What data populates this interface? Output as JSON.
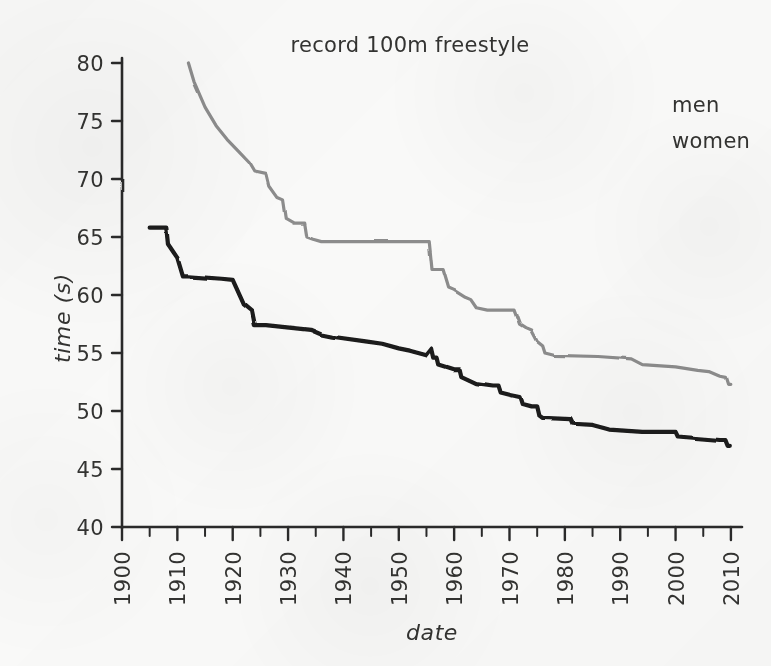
{
  "chart_data": {
    "type": "line",
    "title": "record 100m freestyle",
    "xlabel": "date",
    "ylabel": "time (s)",
    "xlim": [
      1900,
      2012
    ],
    "ylim": [
      40,
      80
    ],
    "xticks": [
      1900,
      1910,
      1920,
      1930,
      1940,
      1950,
      1960,
      1970,
      1980,
      1990,
      2000,
      2010
    ],
    "yticks": [
      40,
      45,
      50,
      55,
      60,
      65,
      70,
      75,
      80
    ],
    "xtick_labels": [
      "1900",
      "1910",
      "1920",
      "1930",
      "1940",
      "1950",
      "1960",
      "1970",
      "1980",
      "1990",
      "2000",
      "2010"
    ],
    "ytick_labels": [
      "40",
      "45",
      "50",
      "55",
      "60",
      "65",
      "70",
      "75",
      "80"
    ],
    "minor_xtick_interval": 5,
    "grid": false,
    "legend_position": "top-right",
    "style": "hand-drawn",
    "series": [
      {
        "name": "men",
        "color": "#1a1a1a",
        "linewidth": 4.2,
        "points": [
          [
            1905.0,
            65.8
          ],
          [
            1908.0,
            65.8
          ],
          [
            1908.3,
            64.4
          ],
          [
            1910.0,
            63.2
          ],
          [
            1911.0,
            61.6
          ],
          [
            1912.0,
            61.6
          ],
          [
            1918.0,
            61.4
          ],
          [
            1920.0,
            61.3
          ],
          [
            1922.0,
            59.2
          ],
          [
            1923.5,
            58.6
          ],
          [
            1924.0,
            57.4
          ],
          [
            1926.0,
            57.4
          ],
          [
            1934.0,
            57.0
          ],
          [
            1936.0,
            56.6
          ],
          [
            1938.0,
            56.4
          ],
          [
            1944.0,
            56.0
          ],
          [
            1947.0,
            55.8
          ],
          [
            1950.0,
            55.4
          ],
          [
            1952.0,
            55.2
          ],
          [
            1955.0,
            54.8
          ],
          [
            1956.0,
            55.4
          ],
          [
            1956.4,
            54.6
          ],
          [
            1957.0,
            54.6
          ],
          [
            1957.3,
            54.0
          ],
          [
            1960.0,
            53.6
          ],
          [
            1961.0,
            53.6
          ],
          [
            1961.3,
            53.0
          ],
          [
            1964.0,
            52.4
          ],
          [
            1967.0,
            52.2
          ],
          [
            1968.0,
            52.2
          ],
          [
            1968.4,
            51.6
          ],
          [
            1970.0,
            51.4
          ],
          [
            1972.0,
            51.2
          ],
          [
            1972.4,
            50.6
          ],
          [
            1974.0,
            50.4
          ],
          [
            1975.0,
            50.4
          ],
          [
            1975.4,
            49.6
          ],
          [
            1976.0,
            49.4
          ],
          [
            1981.0,
            49.3
          ],
          [
            1981.4,
            48.9
          ],
          [
            1985.0,
            48.8
          ],
          [
            1988.0,
            48.4
          ],
          [
            1994.0,
            48.2
          ],
          [
            2000.0,
            48.2
          ],
          [
            2000.4,
            47.8
          ],
          [
            2008.0,
            47.5
          ],
          [
            2009.0,
            47.5
          ],
          [
            2009.4,
            47.0
          ],
          [
            2009.8,
            47.0
          ]
        ]
      },
      {
        "name": "women",
        "color": "#8c8c8c",
        "linewidth": 3.2,
        "points": [
          [
            1912.0,
            80.0
          ],
          [
            1913.0,
            78.4
          ],
          [
            1915.0,
            76.2
          ],
          [
            1917.0,
            74.6
          ],
          [
            1919.0,
            73.4
          ],
          [
            1921.0,
            72.4
          ],
          [
            1923.0,
            71.4
          ],
          [
            1924.0,
            70.6
          ],
          [
            1926.0,
            70.4
          ],
          [
            1926.5,
            69.4
          ],
          [
            1928.0,
            68.4
          ],
          [
            1929.0,
            68.2
          ],
          [
            1929.5,
            66.6
          ],
          [
            1931.0,
            66.2
          ],
          [
            1933.0,
            66.2
          ],
          [
            1933.4,
            65.0
          ],
          [
            1934.5,
            64.8
          ],
          [
            1936.0,
            64.6
          ],
          [
            1955.5,
            64.6
          ],
          [
            1956.0,
            62.2
          ],
          [
            1958.0,
            62.2
          ],
          [
            1959.0,
            60.6
          ],
          [
            1960.0,
            60.4
          ],
          [
            1962.0,
            59.8
          ],
          [
            1963.0,
            59.6
          ],
          [
            1964.0,
            58.9
          ],
          [
            1966.0,
            58.7
          ],
          [
            1971.0,
            58.7
          ],
          [
            1972.0,
            57.4
          ],
          [
            1973.0,
            57.1
          ],
          [
            1974.0,
            56.9
          ],
          [
            1975.0,
            56.0
          ],
          [
            1976.0,
            55.6
          ],
          [
            1976.4,
            55.0
          ],
          [
            1978.0,
            54.8
          ],
          [
            1986.0,
            54.7
          ],
          [
            1992.0,
            54.5
          ],
          [
            1994.0,
            54.0
          ],
          [
            2000.0,
            53.8
          ],
          [
            2004.0,
            53.5
          ],
          [
            2006.0,
            53.4
          ],
          [
            2008.0,
            53.0
          ],
          [
            2009.0,
            52.9
          ],
          [
            2009.4,
            52.3
          ],
          [
            2009.8,
            52.3
          ]
        ]
      }
    ]
  },
  "legend": {
    "entries": [
      {
        "label": "men",
        "color": "#1a1a1a"
      },
      {
        "label": "women",
        "color": "#8c8c8c"
      }
    ]
  },
  "axes": {
    "x_title": "date",
    "y_title": "time (s)"
  },
  "title": "record 100m freestyle"
}
